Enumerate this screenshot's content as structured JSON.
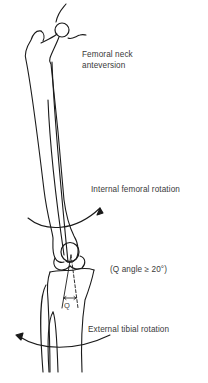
{
  "diagram": {
    "labels": {
      "femoral_neck": "Femoral neck\nanteversion",
      "internal_rotation": "Internal femoral rotation",
      "q_angle": "(Q angle ≥ 20°)",
      "external_rotation": "External tibial rotation",
      "q_marker": "Q"
    },
    "nodes": [
      {
        "id": "femur",
        "label": "Femur"
      },
      {
        "id": "femoral-head",
        "label": "Femoral head"
      },
      {
        "id": "patella",
        "label": "Patella"
      },
      {
        "id": "tibia",
        "label": "Tibia"
      },
      {
        "id": "fibula",
        "label": "Fibula"
      }
    ],
    "arrows": [
      {
        "id": "internal-femoral-rotation-arrow",
        "direction": "counter-clockwise arc, arrowhead upper right"
      },
      {
        "id": "external-tibial-rotation-arrow",
        "direction": "arc, arrowhead upper left"
      }
    ],
    "colors": {
      "line": "#1a1a1a",
      "text": "#3a3a3a",
      "background": "#ffffff"
    }
  }
}
